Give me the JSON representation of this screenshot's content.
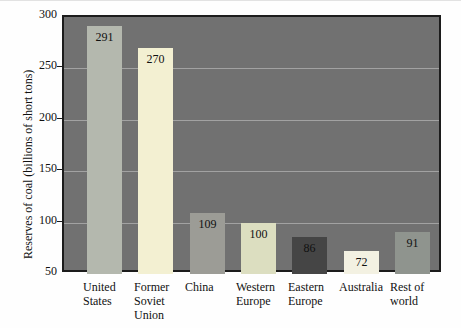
{
  "chart_data": {
    "type": "bar",
    "title": "",
    "xlabel": "",
    "ylabel": "Reserves of coal (billions of short tons)",
    "categories": [
      "United States",
      "Former Soviet Union",
      "China",
      "Western Europe",
      "Eastern Europe",
      "Australia",
      "Rest of world"
    ],
    "category_label_lines": [
      [
        "United",
        "States"
      ],
      [
        "Former",
        "Soviet",
        "Union"
      ],
      [
        "China"
      ],
      [
        "Western",
        "Europe"
      ],
      [
        "Eastern",
        "Europe"
      ],
      [
        "Australia"
      ],
      [
        "Rest of",
        "world"
      ]
    ],
    "values": [
      291,
      270,
      109,
      100,
      86,
      72,
      91
    ],
    "value_labels": [
      "291",
      "270",
      "109",
      "100",
      "86",
      "72",
      "91"
    ],
    "ylim": [
      50,
      300
    ],
    "yticks": [
      300,
      250,
      200,
      150,
      100,
      50
    ],
    "grid": true,
    "legend": false,
    "bar_colors": [
      "#b4b8ae",
      "#f3f0d2",
      "#9c9c96",
      "#dcdec0",
      "#454545",
      "#f3f1e2",
      "#8f948e"
    ],
    "plot_background": "#717171",
    "gridline_color": "#a2a2a2",
    "border_color": "#1c1c1c",
    "text_color": "#111111"
  }
}
